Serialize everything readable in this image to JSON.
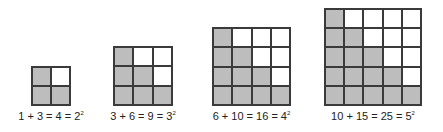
{
  "colors": {
    "shaded": "#bdbdbd",
    "blank": "#ffffff",
    "line": "#3a3a3a"
  },
  "figures": [
    {
      "n": 2,
      "lower": 1,
      "upper": 3,
      "total": 4,
      "label_main": "1 + 3 = 4 = 2",
      "exponent": "2"
    },
    {
      "n": 3,
      "lower": 3,
      "upper": 6,
      "total": 9,
      "label_main": "3 + 6 = 9 = 3",
      "exponent": "2"
    },
    {
      "n": 4,
      "lower": 6,
      "upper": 10,
      "total": 16,
      "label_main": "6 + 10 = 16 = 4",
      "exponent": "2"
    },
    {
      "n": 5,
      "lower": 10,
      "upper": 15,
      "total": 25,
      "label_main": "10 + 15 = 25 = 5",
      "exponent": "2"
    }
  ]
}
